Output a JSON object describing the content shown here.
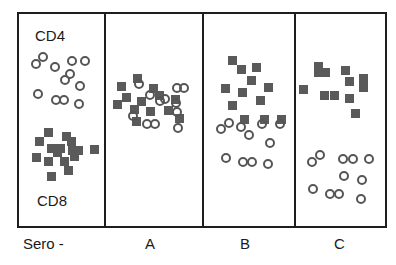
{
  "diagram": {
    "cell_types": {
      "circle": "CD4",
      "square": "CD8"
    },
    "panel_labels": {
      "cd4": "CD4",
      "cd8": "CD8"
    },
    "columns": [
      {
        "id": "sero-neg",
        "label": "Sero -"
      },
      {
        "id": "a",
        "label": "A"
      },
      {
        "id": "b",
        "label": "B"
      },
      {
        "id": "c",
        "label": "C"
      }
    ],
    "colors": {
      "frame": "#1e1e1e",
      "square_fill": "#5a5a5a",
      "circle_stroke": "#555555",
      "background": "#ffffff"
    },
    "markers": {
      "sero-neg": {
        "circles": [
          [
            36,
            64
          ],
          [
            43,
            57
          ],
          [
            55,
            67
          ],
          [
            72,
            61
          ],
          [
            85,
            61
          ],
          [
            65,
            80
          ],
          [
            70,
            74
          ],
          [
            80,
            86
          ],
          [
            38,
            94
          ],
          [
            56,
            100
          ],
          [
            64,
            100
          ],
          [
            79,
            104
          ]
        ],
        "squares": [
          [
            48,
            132
          ],
          [
            39,
            141
          ],
          [
            66,
            136
          ],
          [
            71,
            141
          ],
          [
            51,
            148
          ],
          [
            60,
            148
          ],
          [
            57,
            152
          ],
          [
            72,
            150
          ],
          [
            78,
            150
          ],
          [
            94,
            149
          ],
          [
            36,
            157
          ],
          [
            64,
            161
          ],
          [
            48,
            161
          ],
          [
            74,
            156
          ],
          [
            51,
            176
          ],
          [
            68,
            170
          ]
        ]
      },
      "a": {
        "circles": [
          [
            139,
            84
          ],
          [
            150,
            95
          ],
          [
            177,
            88
          ],
          [
            184,
            88
          ],
          [
            160,
            101
          ],
          [
            165,
            99
          ],
          [
            176,
            103
          ],
          [
            133,
            116
          ],
          [
            147,
            124
          ],
          [
            155,
            124
          ],
          [
            177,
            112
          ],
          [
            178,
            128
          ]
        ],
        "squares": [
          [
            137,
            78
          ],
          [
            121,
            86
          ],
          [
            126,
            97
          ],
          [
            141,
            101
          ],
          [
            153,
            88
          ],
          [
            159,
            95
          ],
          [
            134,
            109
          ],
          [
            150,
            111
          ],
          [
            168,
            110
          ],
          [
            175,
            99
          ],
          [
            117,
            104
          ],
          [
            179,
            118
          ],
          [
            136,
            121
          ]
        ]
      },
      "b": {
        "circles": [
          [
            229,
            123
          ],
          [
            221,
            129
          ],
          [
            241,
            127
          ],
          [
            249,
            135
          ],
          [
            262,
            124
          ],
          [
            280,
            124
          ],
          [
            270,
            143
          ],
          [
            226,
            158
          ],
          [
            243,
            162
          ],
          [
            252,
            162
          ],
          [
            268,
            164
          ]
        ],
        "squares": [
          [
            232,
            60
          ],
          [
            241,
            69
          ],
          [
            256,
            67
          ],
          [
            251,
            80
          ],
          [
            225,
            88
          ],
          [
            242,
            92
          ],
          [
            268,
            87
          ],
          [
            260,
            100
          ],
          [
            232,
            105
          ],
          [
            244,
            119
          ],
          [
            264,
            119
          ],
          [
            281,
            119
          ]
        ]
      },
      "c": {
        "circles": [
          [
            312,
            162
          ],
          [
            320,
            155
          ],
          [
            343,
            159
          ],
          [
            353,
            159
          ],
          [
            369,
            159
          ],
          [
            344,
            176
          ],
          [
            362,
            180
          ],
          [
            313,
            189
          ],
          [
            330,
            194
          ],
          [
            339,
            194
          ],
          [
            361,
            199
          ]
        ],
        "squares": [
          [
            318,
            66
          ],
          [
            318,
            72
          ],
          [
            325,
            72
          ],
          [
            345,
            70
          ],
          [
            349,
            81
          ],
          [
            363,
            78
          ],
          [
            363,
            87
          ],
          [
            303,
            89
          ],
          [
            324,
            95
          ],
          [
            334,
            95
          ],
          [
            349,
            98
          ],
          [
            355,
            113
          ]
        ]
      }
    }
  }
}
